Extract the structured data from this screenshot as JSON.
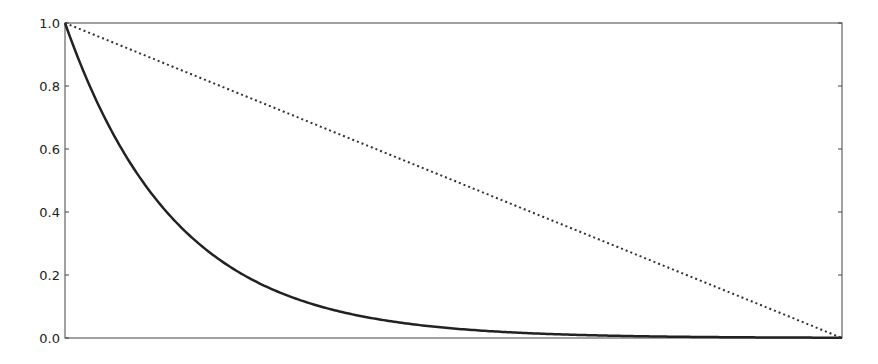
{
  "chart_data": {
    "type": "line",
    "title": "",
    "xlabel": "",
    "ylabel": "",
    "xlim": [
      0,
      1
    ],
    "ylim": [
      0.0,
      1.0
    ],
    "grid": false,
    "legend": null,
    "yticks": [
      "0.0",
      "0.2",
      "0.4",
      "0.6",
      "0.8",
      "1.0"
    ],
    "xticks": [],
    "series": [
      {
        "name": "exponential decay",
        "style": "solid",
        "color": "#222222",
        "x": [
          0,
          0.05,
          0.1,
          0.15,
          0.2,
          0.25,
          0.3,
          0.4,
          0.5,
          0.6,
          0.7,
          0.8,
          0.9,
          1.0
        ],
        "values": [
          1.0,
          0.705,
          0.497,
          0.35,
          0.247,
          0.174,
          0.122,
          0.061,
          0.03,
          0.015,
          0.007,
          0.004,
          0.002,
          0.001
        ]
      },
      {
        "name": "linear",
        "style": "dotted",
        "color": "#333333",
        "x": [
          0,
          1
        ],
        "values": [
          1.0,
          0.0
        ]
      }
    ]
  }
}
